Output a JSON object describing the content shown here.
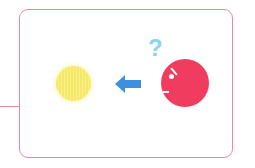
{
  "diagram": {
    "elements": [
      {
        "id": "yellow-ball",
        "shape": "circle",
        "color": "#f5e867"
      },
      {
        "id": "arrow",
        "direction": "left",
        "color": "#3d8fe0"
      },
      {
        "id": "red-ball",
        "shape": "circle",
        "color": "#ef3c5f",
        "features": [
          "eye",
          "eyebrow",
          "mouth"
        ]
      },
      {
        "id": "question-mark",
        "text": "?",
        "color": "#8dd3ef"
      }
    ],
    "question_mark": "?",
    "colors": {
      "border": "#e88a9a",
      "yellow": "#f5e867",
      "arrow": "#3d8fe0",
      "red": "#ef3c5f",
      "question": "#8dd3ef"
    }
  }
}
